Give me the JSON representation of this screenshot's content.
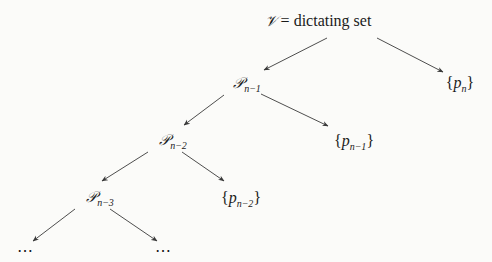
{
  "diagram": {
    "type": "tree",
    "root": {
      "symbol": "𝒱",
      "equals": " = ",
      "label": "dictating set"
    },
    "nodes": [
      {
        "id": "Pn1",
        "symbol": "𝒫",
        "subscript": "n−1"
      },
      {
        "id": "pn",
        "open": "{",
        "var": "p",
        "subscript": "n",
        "close": "}"
      },
      {
        "id": "Pn2",
        "symbol": "𝒫",
        "subscript": "n−2"
      },
      {
        "id": "pn1",
        "open": "{",
        "var": "p",
        "subscript": "n−1",
        "close": "}"
      },
      {
        "id": "Pn3",
        "symbol": "𝒫",
        "subscript": "n−3"
      },
      {
        "id": "pn2",
        "open": "{",
        "var": "p",
        "subscript": "n−2",
        "close": "}"
      },
      {
        "id": "dotsL",
        "label": "⋯"
      },
      {
        "id": "dotsR",
        "label": "⋯"
      }
    ],
    "edges": [
      {
        "from": "root",
        "to": "Pn1"
      },
      {
        "from": "root",
        "to": "pn"
      },
      {
        "from": "Pn1",
        "to": "Pn2"
      },
      {
        "from": "Pn1",
        "to": "pn1"
      },
      {
        "from": "Pn2",
        "to": "Pn3"
      },
      {
        "from": "Pn2",
        "to": "pn2"
      },
      {
        "from": "Pn3",
        "to": "dotsL"
      },
      {
        "from": "Pn3",
        "to": "dotsR"
      }
    ],
    "colors": {
      "background": "#fbfbf9",
      "ink": "#1a1a1a",
      "edge": "#3a3a3a"
    }
  }
}
